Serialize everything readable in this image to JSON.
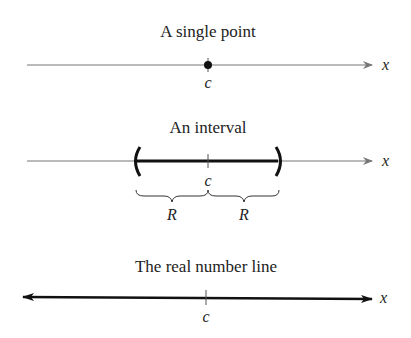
{
  "panels": [
    {
      "title": "A single point",
      "center_label": "c",
      "axis_label": "x",
      "type": "point"
    },
    {
      "title": "An interval",
      "center_label": "c",
      "axis_label": "x",
      "type": "interval",
      "left_radius_label": "R",
      "right_radius_label": "R"
    },
    {
      "title": "The real number line",
      "center_label": "c",
      "axis_label": "x",
      "type": "real-line"
    }
  ],
  "colors": {
    "thin_line": "#777777",
    "thick_line": "#111111",
    "text": "#222222"
  }
}
